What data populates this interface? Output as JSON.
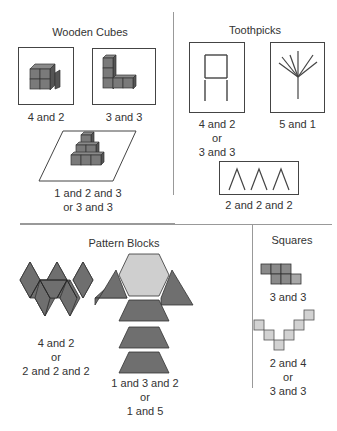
{
  "colors": {
    "dark_fill": "#6f6f6f",
    "light_fill": "#cfcfcf",
    "stroke": "#3a3a3a",
    "divider": "#999999"
  },
  "sections": {
    "wooden_cubes": {
      "title": "Wooden Cubes",
      "items": [
        {
          "label": "4 and 2",
          "icon": "cube-block-2x2-icon"
        },
        {
          "label": "3 and 3",
          "icon": "cube-l-shape-icon"
        },
        {
          "label_line1": "1 and 2 and 3",
          "label_line2": "or 3 and 3",
          "icon": "cube-pyramid-icon"
        }
      ]
    },
    "toothpicks": {
      "title": "Toothpicks",
      "items": [
        {
          "label_line1": "4 and 2",
          "label_line2": "or",
          "label_line3": "3 and 3",
          "icon": "toothpick-square-icon"
        },
        {
          "label": "5 and 1",
          "icon": "toothpick-tree-icon"
        },
        {
          "label": "2 and 2 and 2",
          "icon": "toothpick-triangles-icon"
        }
      ]
    },
    "pattern_blocks": {
      "title": "Pattern Blocks",
      "items": [
        {
          "label_line1": "4 and 2",
          "label_line2": "or",
          "label_line3": "2 and 2 and 2",
          "icon": "rhombus-pattern-icon"
        },
        {
          "label_line1": "1 and 3 and 2",
          "label_line2": "or",
          "label_line3": "1 and 5",
          "icon": "hexagon-trapezoid-pattern-icon"
        }
      ]
    },
    "squares": {
      "title": "Squares",
      "items": [
        {
          "label": "3 and 3",
          "icon": "square-tiles-icon"
        },
        {
          "label_line1": "2 and 4",
          "label_line2": "or",
          "label_line3": "3 and 3",
          "icon": "square-v-shape-icon"
        }
      ]
    }
  }
}
